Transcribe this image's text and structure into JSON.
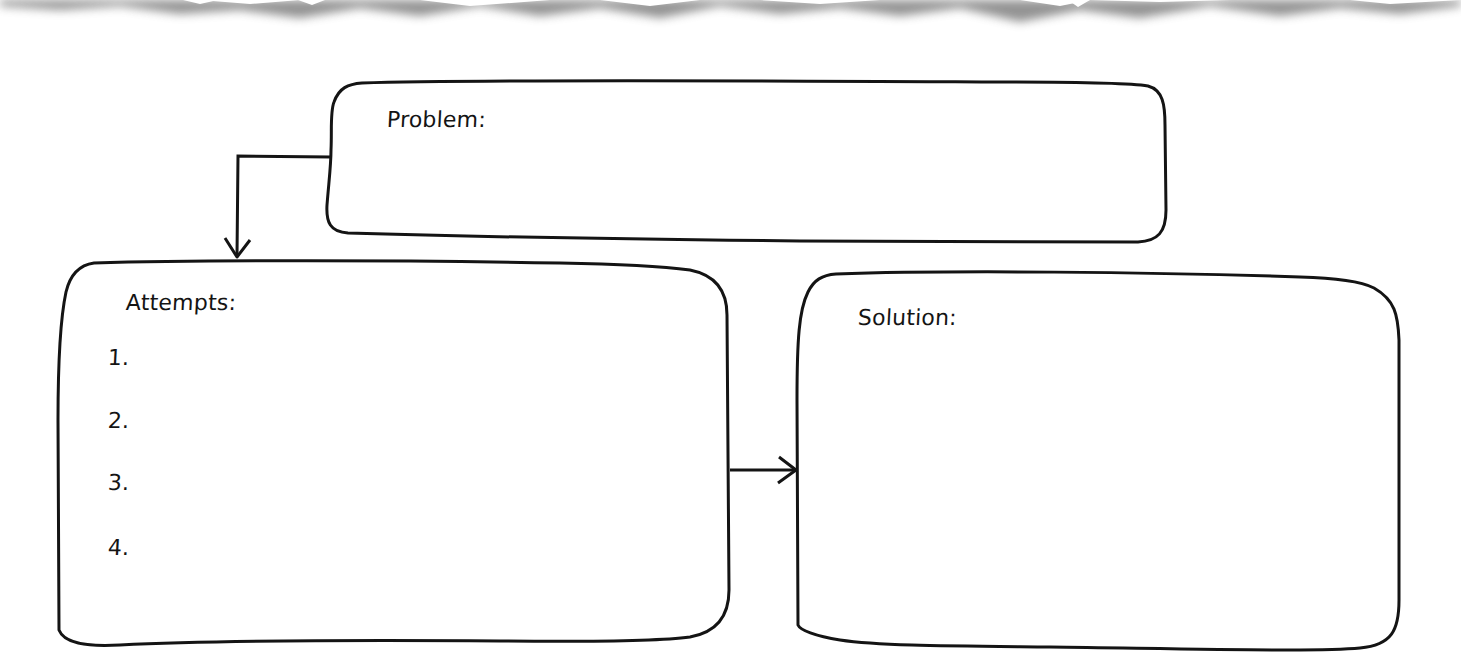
{
  "diagram": {
    "type": "problem-solving flowchart worksheet",
    "colors": {
      "stroke": "#141414",
      "background": "#ffffff",
      "torn_edge_shadow": "#7a7a7a"
    },
    "boxes": {
      "problem": {
        "label": "Problem:"
      },
      "attempts": {
        "label": "Attempts:",
        "items": [
          "1.",
          "2.",
          "3.",
          "4."
        ]
      },
      "solution": {
        "label": "Solution:"
      }
    },
    "connectors": [
      {
        "from": "problem",
        "to": "attempts",
        "icon": "arrow-down-icon"
      },
      {
        "from": "attempts",
        "to": "solution",
        "icon": "arrow-right-icon"
      }
    ]
  }
}
